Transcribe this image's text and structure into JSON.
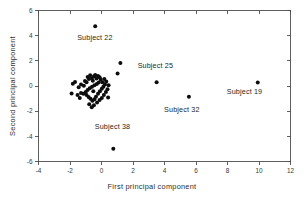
{
  "chart_data": {
    "type": "scatter",
    "title": "",
    "xlabel": "First principal component",
    "ylabel": "Second principal component",
    "xlim": [
      -4,
      12
    ],
    "ylim": [
      -6,
      6
    ],
    "xticks": [
      -4,
      -2,
      0,
      2,
      4,
      6,
      8,
      10,
      12
    ],
    "yticks": [
      -6,
      -4,
      -2,
      0,
      2,
      4,
      6
    ],
    "xticklabels": [
      "-4",
      "-2",
      "0",
      "2",
      "4",
      "6",
      "8",
      "10",
      "12"
    ],
    "yticklabels": [
      "-6",
      "-4",
      "-2",
      "0",
      "2",
      "4",
      "6"
    ],
    "grid": false,
    "legend": false,
    "marker": "filled-circle",
    "marker_color": "#0d0d0d",
    "marker_size": 3.1,
    "series": [
      {
        "name": "subjects",
        "points": [
          [
            -0.4,
            4.75
          ],
          [
            1.2,
            1.82
          ],
          [
            1.02,
            1.0
          ],
          [
            3.5,
            0.3
          ],
          [
            9.92,
            0.28
          ],
          [
            5.55,
            -0.85
          ],
          [
            0.75,
            -4.98
          ],
          [
            -1.82,
            0.18
          ],
          [
            -1.68,
            0.32
          ],
          [
            -1.9,
            -0.6
          ],
          [
            -1.45,
            -0.1
          ],
          [
            -1.3,
            0.12
          ],
          [
            -1.12,
            0.02
          ],
          [
            -1.05,
            0.4
          ],
          [
            -0.95,
            0.3
          ],
          [
            -0.88,
            0.72
          ],
          [
            -0.8,
            0.55
          ],
          [
            -0.72,
            0.85
          ],
          [
            -0.62,
            0.62
          ],
          [
            -0.55,
            0.42
          ],
          [
            -0.48,
            0.78
          ],
          [
            -0.4,
            0.88
          ],
          [
            -0.32,
            0.6
          ],
          [
            -0.22,
            0.8
          ],
          [
            -0.12,
            0.7
          ],
          [
            -0.05,
            0.52
          ],
          [
            -0.18,
            0.28
          ],
          [
            -0.3,
            0.15
          ],
          [
            -0.45,
            0.05
          ],
          [
            -0.6,
            -0.05
          ],
          [
            -0.75,
            -0.18
          ],
          [
            -0.88,
            -0.32
          ],
          [
            -1.0,
            -0.48
          ],
          [
            -1.15,
            -0.62
          ],
          [
            -1.3,
            -0.55
          ],
          [
            -0.95,
            -0.72
          ],
          [
            -0.82,
            -0.88
          ],
          [
            -0.7,
            -1.02
          ],
          [
            -0.58,
            -1.18
          ],
          [
            -0.45,
            -1.05
          ],
          [
            -0.35,
            -0.85
          ],
          [
            -0.22,
            -0.62
          ],
          [
            -0.1,
            -0.42
          ],
          [
            0.02,
            -0.22
          ],
          [
            0.12,
            -0.05
          ],
          [
            0.22,
            0.12
          ],
          [
            0.3,
            0.35
          ],
          [
            0.18,
            0.55
          ],
          [
            0.05,
            0.3
          ],
          [
            0.38,
            -0.25
          ],
          [
            0.28,
            -0.48
          ],
          [
            0.15,
            -0.72
          ],
          [
            0.02,
            -0.95
          ],
          [
            -0.12,
            -1.12
          ],
          [
            -0.28,
            -1.32
          ],
          [
            -0.48,
            -1.52
          ],
          [
            -0.62,
            -1.68
          ],
          [
            -0.78,
            -1.45
          ],
          [
            -1.38,
            -0.95
          ],
          [
            -1.52,
            -0.72
          ],
          [
            -0.52,
            -0.42
          ],
          [
            0.45,
            0.05
          ],
          [
            0.42,
            -0.92
          ]
        ]
      }
    ],
    "annotations": [
      {
        "text": "Subject 22",
        "x": -0.42,
        "y": 3.62
      },
      {
        "text": "Subject 25",
        "x": 3.42,
        "y": 1.42
      },
      {
        "text": "Subject 19",
        "x": 9.08,
        "y": -0.66
      },
      {
        "text": "Subject 32",
        "x": 5.1,
        "y": -2.08
      },
      {
        "text": "Subject 38",
        "x": 0.7,
        "y": -3.42
      }
    ]
  }
}
